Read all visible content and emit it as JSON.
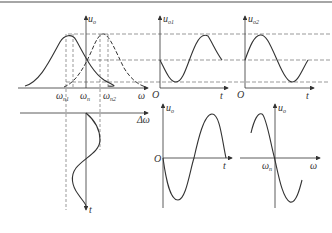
{
  "figure": {
    "top_rule_color": "#888888",
    "ink_color": "#333333",
    "panels": {
      "frequency_response": {
        "y_axis_label": "u",
        "y_axis_sub": "o",
        "x_axis_label": "ω",
        "ticks": [
          {
            "main": "ω",
            "sub": "n1"
          },
          {
            "main": "ω",
            "sub": "n"
          },
          {
            "main": "ω",
            "sub": "n2"
          }
        ],
        "curves": [
          "solid resonance curve centered at ω_n1",
          "dashed resonance curve centered at ω_n2"
        ]
      },
      "output_1": {
        "y_axis_label": "u",
        "y_axis_sub": "o1",
        "origin_label": "O",
        "x_axis_label": "t"
      },
      "output_2": {
        "y_axis_label": "u",
        "y_axis_sub": "o2",
        "origin_label": "O",
        "x_axis_label": "t"
      },
      "deviation": {
        "x_axis_label": "Δω",
        "y_axis_label": "t"
      },
      "output_time": {
        "y_axis_label": "u",
        "y_axis_sub": "o",
        "origin_label": "O",
        "x_axis_label": "t"
      },
      "discriminator": {
        "y_axis_label": "u",
        "y_axis_sub": "o",
        "x_axis_label": "ω",
        "center_tick": {
          "main": "ω",
          "sub": "n"
        }
      }
    }
  }
}
